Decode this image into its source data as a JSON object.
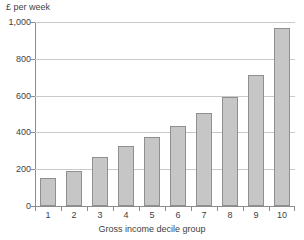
{
  "chart_data": {
    "type": "bar",
    "title": "",
    "xlabel": "Gross income decile group",
    "ylabel": "£ per week",
    "categories": [
      "1",
      "2",
      "3",
      "4",
      "5",
      "6",
      "7",
      "8",
      "9",
      "10"
    ],
    "values": [
      150,
      192,
      266,
      327,
      375,
      435,
      505,
      593,
      712,
      968
    ],
    "ylim": [
      0,
      1000
    ],
    "ytick_labels": [
      "0",
      "200",
      "400",
      "600",
      "800",
      "1,000"
    ],
    "ytick_values": [
      0,
      200,
      400,
      600,
      800,
      1000
    ],
    "grid": true,
    "legend": false,
    "bar_fill_color": "#c6c6c6",
    "bar_edge_color": "#8f8f8f",
    "axis_color": "#8c8c8c",
    "gridline_color": "#c9c9c9",
    "text_color": "#3f3f3f"
  }
}
